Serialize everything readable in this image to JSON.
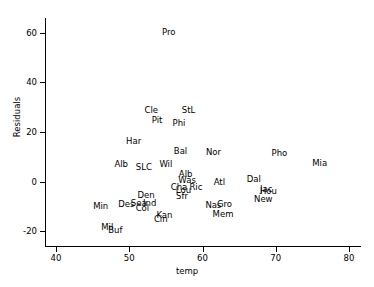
{
  "chart_data": {
    "type": "scatter",
    "title": "",
    "xlabel": "temp",
    "ylabel": "Residuals",
    "xlim": [
      38.5,
      81.5
    ],
    "ylim": [
      -26,
      66
    ],
    "xticks": [
      40,
      50,
      60,
      70,
      80
    ],
    "yticks": [
      -20,
      0,
      20,
      40,
      60
    ],
    "grid": false,
    "legend": null,
    "marker": "text-label",
    "note": "Each data point is rendered as a 3-letter city abbreviation instead of a marker glyph.",
    "points": [
      {
        "label": "Pro",
        "x": 55.4,
        "y": 60.5
      },
      {
        "label": "Cle",
        "x": 53.0,
        "y": 29.0
      },
      {
        "label": "StL",
        "x": 58.1,
        "y": 29.0
      },
      {
        "label": "Pit",
        "x": 53.8,
        "y": 25.0
      },
      {
        "label": "Phi",
        "x": 56.8,
        "y": 23.5
      },
      {
        "label": "Har",
        "x": 50.6,
        "y": 16.5
      },
      {
        "label": "Bal",
        "x": 57.0,
        "y": 12.5
      },
      {
        "label": "Nor",
        "x": 61.5,
        "y": 12.0
      },
      {
        "label": "Pho",
        "x": 70.5,
        "y": 11.5
      },
      {
        "label": "Alb",
        "x": 48.9,
        "y": 7.0
      },
      {
        "label": "SLC",
        "x": 52.0,
        "y": 6.0
      },
      {
        "label": "Wil",
        "x": 55.0,
        "y": 7.0
      },
      {
        "label": "Mia",
        "x": 76.0,
        "y": 7.5
      },
      {
        "label": "Alb",
        "x": 57.7,
        "y": 3.0
      },
      {
        "label": "Was",
        "x": 57.9,
        "y": 0.5
      },
      {
        "label": "Atl",
        "x": 62.3,
        "y": 0.0
      },
      {
        "label": "Dal",
        "x": 67.0,
        "y": 1.0
      },
      {
        "label": "Cha",
        "x": 56.8,
        "y": -2.0
      },
      {
        "label": "Ric",
        "x": 59.1,
        "y": -2.0
      },
      {
        "label": "Lou",
        "x": 57.4,
        "y": -3.5
      },
      {
        "label": "Jac",
        "x": 68.7,
        "y": -3.0
      },
      {
        "label": "Hou",
        "x": 69.0,
        "y": -4.0
      },
      {
        "label": "Den",
        "x": 52.3,
        "y": -5.5
      },
      {
        "label": "Sfr",
        "x": 57.2,
        "y": -6.0
      },
      {
        "label": "New",
        "x": 68.3,
        "y": -7.0
      },
      {
        "label": "Sea",
        "x": 51.3,
        "y": -8.5
      },
      {
        "label": "Ind",
        "x": 52.8,
        "y": -8.5
      },
      {
        "label": "Des",
        "x": 49.6,
        "y": -9.0
      },
      {
        "label": "Nas",
        "x": 61.5,
        "y": -9.5
      },
      {
        "label": "Gro",
        "x": 63.0,
        "y": -9.0
      },
      {
        "label": "Col",
        "x": 51.8,
        "y": -10.5
      },
      {
        "label": "Min",
        "x": 46.1,
        "y": -10.0
      },
      {
        "label": "Mem",
        "x": 62.8,
        "y": -13.0
      },
      {
        "label": "Kan",
        "x": 54.8,
        "y": -13.5
      },
      {
        "label": "Cin",
        "x": 54.3,
        "y": -15.0
      },
      {
        "label": "Mil",
        "x": 47.0,
        "y": -18.5
      },
      {
        "label": "Buf",
        "x": 48.1,
        "y": -19.5
      }
    ]
  }
}
